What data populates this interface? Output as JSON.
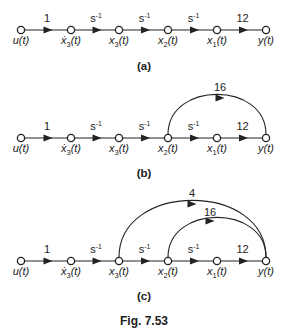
{
  "figure": {
    "caption": "Fig. 7.53",
    "nodes": [
      {
        "id": "u",
        "label": "u(t)",
        "x": 21
      },
      {
        "id": "x3d",
        "label": "ẋ3(t)",
        "x": 71
      },
      {
        "id": "x3",
        "label": "x3(t)",
        "x": 119
      },
      {
        "id": "x2",
        "label": "x2(t)",
        "x": 168
      },
      {
        "id": "x1",
        "label": "x1(t)",
        "x": 217
      },
      {
        "id": "y",
        "label": "y(t)",
        "x": 266
      }
    ],
    "forward_gains": [
      "1",
      "s-1",
      "s-1",
      "s-1",
      "12"
    ],
    "panels": [
      {
        "label": "(a)",
        "row_y": 30,
        "label_y": 70,
        "feedforward": []
      },
      {
        "label": "(b)",
        "row_y": 138,
        "label_y": 177,
        "feedforward": [
          {
            "from": "x2",
            "to": "y",
            "gain": "16",
            "top_y": 98,
            "label_x": 220,
            "label_y": 91
          }
        ]
      },
      {
        "label": "(c)",
        "row_y": 261,
        "label_y": 300,
        "feedforward": [
          {
            "from": "x3",
            "to": "y",
            "gain": "4",
            "top_y": 204,
            "label_x": 192,
            "label_y": 197
          },
          {
            "from": "x2",
            "to": "y",
            "gain": "16",
            "top_y": 221,
            "label_x": 210,
            "label_y": 216
          }
        ]
      }
    ],
    "caption_y": 325
  }
}
